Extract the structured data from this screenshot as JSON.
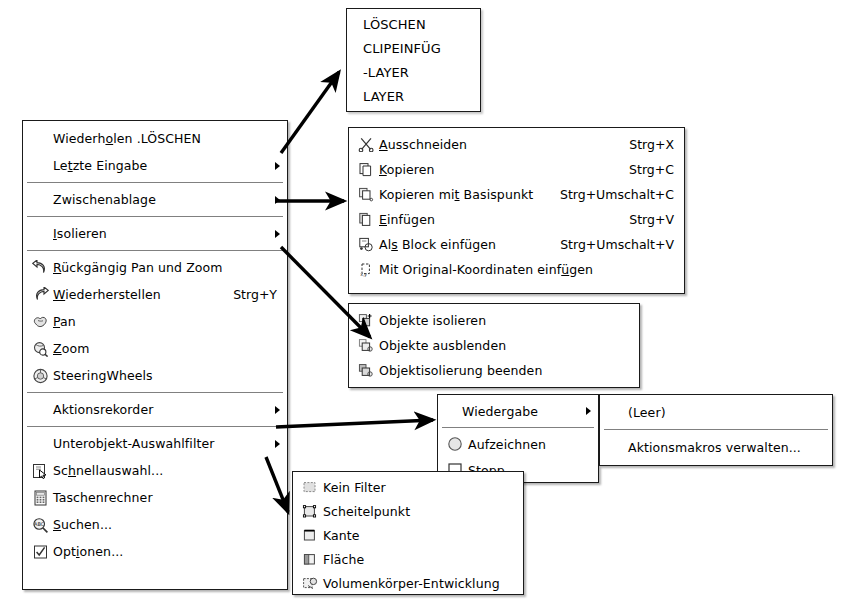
{
  "repeat_list": {
    "title": "repeat-command-list",
    "items": [
      {
        "label": "LÖSCHEN"
      },
      {
        "label": "CLIPEINFÜG"
      },
      {
        "label": "-LAYER"
      },
      {
        "label": "LAYER"
      }
    ]
  },
  "main_menu": {
    "items": [
      {
        "label": "Wiederh",
        "label_full": "Wiederholen .LÖSCHEN",
        "mnemonic": "o",
        "label_pre": "Wiederh",
        "label_post": "len .LÖSCHEN",
        "icon": "none",
        "submenu": false,
        "accel": ""
      },
      {
        "label": "Letzte Eingabe",
        "label_pre": "Le",
        "mnemonic": "t",
        "label_post": "zte Eingabe",
        "icon": "none",
        "submenu": true,
        "accel": ""
      },
      {
        "separator": true
      },
      {
        "label": "Zwischenablage",
        "label_pre": "Zwischenablage",
        "mnemonic": "",
        "label_post": "",
        "icon": "none",
        "submenu": true,
        "accel": ""
      },
      {
        "separator": true
      },
      {
        "label": "Isolieren",
        "label_pre": "",
        "mnemonic": "I",
        "label_post": "solieren",
        "icon": "none",
        "submenu": true,
        "accel": ""
      },
      {
        "separator": true
      },
      {
        "label": "Rückgängig Pan und Zoom",
        "label_pre": "",
        "mnemonic": "R",
        "label_post": "ückgängig Pan und Zoom",
        "icon": "undo-arrow-icon",
        "submenu": false,
        "accel": ""
      },
      {
        "label": "Wiederherstellen",
        "label_pre": "",
        "mnemonic": "W",
        "label_post": "iederherstellen",
        "icon": "redo-arrow-icon",
        "submenu": false,
        "accel": "Strg+Y"
      },
      {
        "label": "Pan",
        "label_pre": "",
        "mnemonic": "P",
        "label_post": "an",
        "icon": "pan-hand-icon",
        "submenu": false,
        "accel": ""
      },
      {
        "label": "Zoom",
        "label_pre": "",
        "mnemonic": "Z",
        "label_post": "oom",
        "icon": "zoom-magnifier-icon",
        "submenu": false,
        "accel": ""
      },
      {
        "label": "SteeringWheels",
        "label_pre": "SteeringWheels",
        "mnemonic": "",
        "label_post": "",
        "icon": "steering-wheel-icon",
        "submenu": false,
        "accel": ""
      },
      {
        "separator": true
      },
      {
        "label": "Aktionsrekorder",
        "label_pre": "Aktionsrekorder",
        "mnemonic": "",
        "label_post": "",
        "icon": "none",
        "submenu": true,
        "accel": ""
      },
      {
        "separator": true
      },
      {
        "label": "Unterobjekt-Auswahlfilter",
        "label_pre": "Unterobjekt-Auswahlfilter",
        "mnemonic": "",
        "label_post": "",
        "icon": "none",
        "submenu": true,
        "accel": ""
      },
      {
        "label": "Schnellauswahl...",
        "label_pre": "Sc",
        "mnemonic": "h",
        "label_post": "nellauswahl...",
        "icon": "quick-select-icon",
        "submenu": false,
        "accel": ""
      },
      {
        "label": "Taschenrechner",
        "label_pre": "Taschenrechner",
        "mnemonic": "",
        "label_post": "",
        "icon": "calculator-icon",
        "submenu": false,
        "accel": ""
      },
      {
        "label": "Suchen...",
        "label_pre": "",
        "mnemonic": "S",
        "label_post": "uchen...",
        "icon": "find-abc-icon",
        "submenu": false,
        "accel": ""
      },
      {
        "label": "Optionen...",
        "label_pre": "Opt",
        "mnemonic": "i",
        "label_post": "onen...",
        "icon": "options-check-icon",
        "submenu": false,
        "accel": ""
      }
    ]
  },
  "clipboard_menu": {
    "items": [
      {
        "label": "Ausschneiden",
        "label_pre": "",
        "mnemonic": "A",
        "label_post": "usschneiden",
        "accel": "Strg+X",
        "icon": "scissors-icon"
      },
      {
        "label": "Kopieren",
        "label_pre": "",
        "mnemonic": "K",
        "label_post": "opieren",
        "accel": "Strg+C",
        "icon": "copy-icon"
      },
      {
        "label": "Kopieren mit Basispunkt",
        "label_pre": "Kopieren mi",
        "mnemonic": "t",
        "label_post": " Basispunkt",
        "accel": "Strg+Umschalt+C",
        "icon": "copy-basepoint-icon"
      },
      {
        "label": "Einfügen",
        "label_pre": "",
        "mnemonic": "E",
        "label_post": "infügen",
        "accel": "Strg+V",
        "icon": "paste-icon"
      },
      {
        "label": "Als Block einfügen",
        "label_pre": "Al",
        "mnemonic": "s",
        "label_post": " Block einfügen",
        "accel": "Strg+Umschalt+V",
        "icon": "paste-block-icon"
      },
      {
        "label": "Mit Original-Koordinaten einfügen",
        "label_pre": "Mit Original-Koordinaten einf",
        "mnemonic": "ü",
        "label_post": "gen",
        "accel": "",
        "icon": "paste-coordinates-icon"
      }
    ]
  },
  "isolate_menu": {
    "items": [
      {
        "label": "Objekte isolieren",
        "icon": "isolate-objects-icon"
      },
      {
        "label": "Objekte ausblenden",
        "icon": "hide-objects-icon"
      },
      {
        "label": "Objektisolierung beenden",
        "icon": "end-isolation-icon"
      }
    ]
  },
  "recorder_menu": {
    "items": [
      {
        "label": "Wiedergabe",
        "submenu": true,
        "icon": "none"
      },
      {
        "separator": true
      },
      {
        "label": "Aufzeichnen",
        "submenu": false,
        "icon": "record-circle-icon"
      },
      {
        "label": "Stopp",
        "submenu": false,
        "icon": "stop-square-icon"
      }
    ]
  },
  "macros_menu": {
    "items": [
      {
        "label": "(Leer)"
      },
      {
        "separator": true
      },
      {
        "label": "Aktionsmakros verwalten..."
      }
    ]
  },
  "filter_menu": {
    "items": [
      {
        "label": "Kein Filter",
        "icon": "no-filter-icon"
      },
      {
        "label": "Scheitelpunkt",
        "icon": "vertex-icon"
      },
      {
        "label": "Kante",
        "icon": "edge-icon"
      },
      {
        "label": "Fläche",
        "icon": "face-icon"
      },
      {
        "label": "Volumenkörper-Entwicklung",
        "icon": "solid-history-icon"
      }
    ]
  },
  "colors": {
    "menu_background": "#ffffff",
    "menu_border": "#1a1a1a",
    "text": "#000000",
    "separator": "#808080",
    "arrow": "#000000",
    "icon_fill": "#d4d4d4"
  },
  "connectors": [
    {
      "name": "main-to-repeat-list",
      "from": "Letzte Eingabe",
      "to": "repeat-command-list"
    },
    {
      "name": "main-to-clipboard",
      "from": "Zwischenablage",
      "to": "clipboard-menu"
    },
    {
      "name": "main-to-isolate",
      "from": "Isolieren",
      "to": "isolate-menu"
    },
    {
      "name": "main-to-recorder",
      "from": "Aktionsrekorder",
      "to": "recorder-menu"
    },
    {
      "name": "main-to-filter",
      "from": "Unterobjekt-Auswahlfilter",
      "to": "filter-menu"
    }
  ]
}
